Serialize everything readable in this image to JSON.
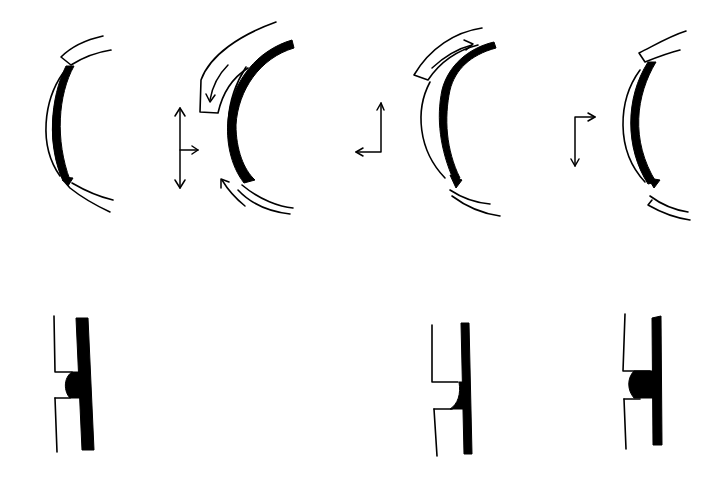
{
  "diagram": {
    "type": "line-drawing",
    "background": "#ffffff",
    "ink_color": "#000000",
    "panels_top": [
      {
        "id": "arc-1",
        "description": "curved cross-section with black inner layer and two separated outer segments"
      },
      {
        "id": "arc-2",
        "description": "curved cross-section with thick black layer; outer segment displaced with curved arrows",
        "motion_arrows": [
          "down-along-outer-arc",
          "up-along-lower-arc"
        ]
      },
      {
        "id": "arc-3",
        "description": "curved cross-section, outer segment displaced upward with arrow along arc"
      },
      {
        "id": "arc-4",
        "description": "curved cross-section with black inner layer and two outer segments"
      }
    ],
    "axis_indicators": [
      {
        "id": "axes-1",
        "arrows": [
          "up",
          "down",
          "right"
        ]
      },
      {
        "id": "axes-2",
        "arrows": [
          "up",
          "left"
        ]
      },
      {
        "id": "axes-3",
        "arrows": [
          "right",
          "down"
        ]
      }
    ],
    "panels_bottom": [
      {
        "id": "detail-1",
        "description": "vertical section with thick black bar and filled rounded notch"
      },
      {
        "id": "detail-2",
        "description": "vertical section with thin black bar and small concave fillet"
      },
      {
        "id": "detail-3",
        "description": "vertical section with black bar and large filled rounded bulge"
      }
    ]
  }
}
